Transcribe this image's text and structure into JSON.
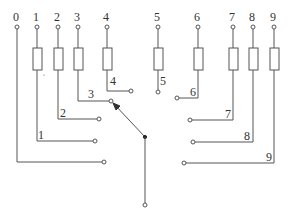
{
  "diagram": {
    "type": "rotary selector switch with resistor taps",
    "colors": {
      "line": "#555555",
      "text": "#333333",
      "background": "#ffffff"
    },
    "top_terminals": [
      {
        "label": "0",
        "x": 17,
        "resistor": false
      },
      {
        "label": "1",
        "x": 37,
        "resistor": true
      },
      {
        "label": "2",
        "x": 58,
        "resistor": true
      },
      {
        "label": "3",
        "x": 78,
        "resistor": true
      },
      {
        "label": "4",
        "x": 107,
        "resistor": true
      },
      {
        "label": "5",
        "x": 158,
        "resistor": true
      },
      {
        "label": "6",
        "x": 198,
        "resistor": true
      },
      {
        "label": "7",
        "x": 233,
        "resistor": true
      },
      {
        "label": "8",
        "x": 253,
        "resistor": true
      },
      {
        "label": "9",
        "x": 274,
        "resistor": true
      }
    ],
    "contacts": [
      {
        "label": "0",
        "show_label": false
      },
      {
        "label": "1"
      },
      {
        "label": "2"
      },
      {
        "label": "3"
      },
      {
        "label": "4"
      },
      {
        "label": "5"
      },
      {
        "label": "6"
      },
      {
        "label": "7"
      },
      {
        "label": "8"
      },
      {
        "label": "9"
      }
    ],
    "wiper": {
      "selected_contact": "3",
      "pivot": "common terminal"
    }
  }
}
